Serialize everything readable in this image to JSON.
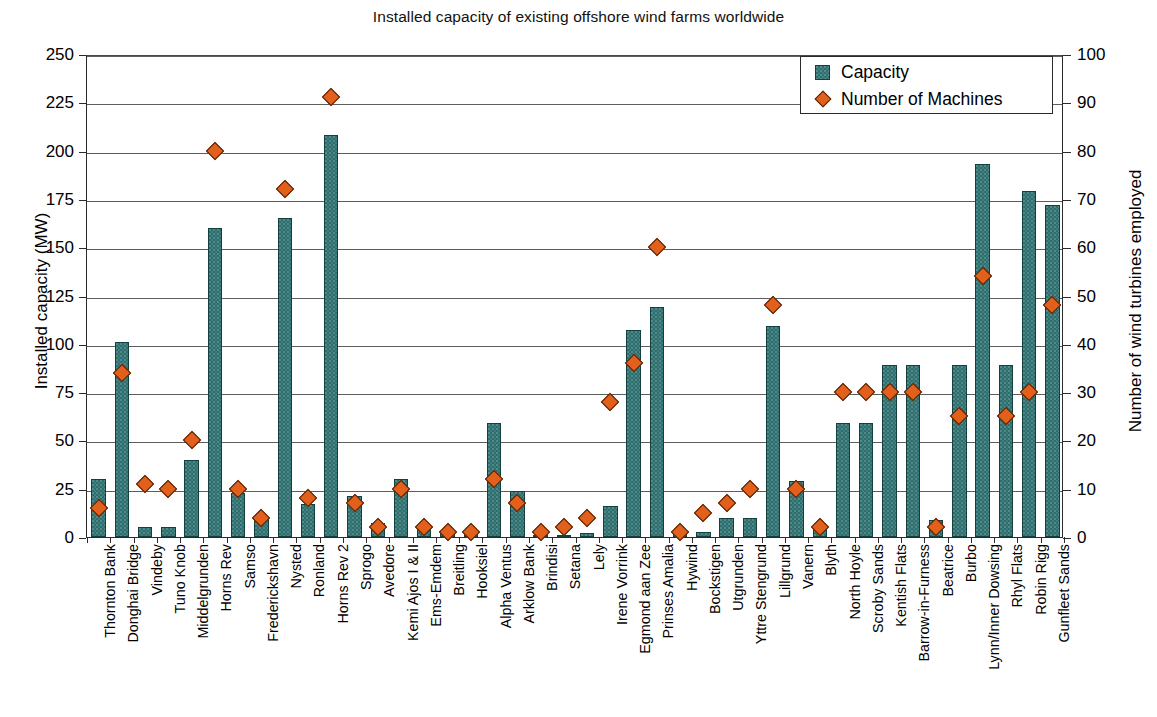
{
  "chart_data": {
    "type": "bar",
    "title": "Installed capacity of existing offshore wind farms worldwide",
    "xlabel": "",
    "ylabel": "Installed capacity (MW)",
    "y2label": "Number of wind turbines employed",
    "ylim": [
      0,
      250
    ],
    "y2lim": [
      0,
      100
    ],
    "yticks": [
      0,
      25,
      50,
      75,
      100,
      125,
      150,
      175,
      200,
      225,
      250
    ],
    "y2ticks": [
      0,
      10,
      20,
      30,
      40,
      50,
      60,
      70,
      80,
      90,
      100
    ],
    "grid": true,
    "legend_position": "top-right",
    "categories": [
      "Thornton Bank",
      "Donghai Bridge",
      "Vindeby",
      "Tuno Knob",
      "Middelgrunden",
      "Horns Rev",
      "Samso",
      "Frederickshavn",
      "Nysted",
      "Ronland",
      "Horns Rev 2",
      "Sprogo",
      "Avedore",
      "Kemi Ajos I & II",
      "Ems-Emdem",
      "Breitling",
      "Hooksiel",
      "Alpha Ventus",
      "Arklow Bank",
      "Brindisi",
      "Setana",
      "Lely",
      "Irene Vorrink",
      "Egmond aan Zee",
      "Prinses Amalia",
      "Hywind",
      "Bockstigen",
      "Utgrunden",
      "Yttre Stengrund",
      "Lillgrund",
      "Vanern",
      "Blyth",
      "North Hoyle",
      "Scroby Sands",
      "Kentish Flats",
      "Barrow-in-Furness",
      "Beatrice",
      "Burbo",
      "Lynn/Inner Dowsing",
      "Rhyl Flats",
      "Robin Rigg",
      "Gunfleet Sands"
    ],
    "series": [
      {
        "name": "Capacity",
        "axis": "left",
        "unit": "MW",
        "color": "#2d6e6e",
        "values": [
          30,
          101,
          5,
          5,
          40,
          160,
          23,
          10,
          165,
          17,
          208,
          21,
          7,
          30,
          4,
          3,
          3,
          59,
          24,
          0,
          1,
          2,
          16,
          107,
          119,
          2,
          2.5,
          10,
          10,
          109,
          29,
          4,
          59,
          59,
          89,
          89,
          9,
          89,
          193,
          89,
          179,
          172
        ]
      },
      {
        "name": "Number of Machines",
        "axis": "right",
        "unit": "turbines",
        "color": "#E2601C",
        "values": [
          6,
          34,
          11,
          10,
          20,
          80,
          10,
          4,
          72,
          8,
          91,
          7,
          2,
          10,
          2,
          1,
          1,
          12,
          7,
          1,
          2,
          4,
          28,
          36,
          60,
          1,
          5,
          7,
          10,
          48,
          10,
          2,
          30,
          30,
          30,
          30,
          2,
          25,
          54,
          25,
          30,
          48
        ]
      }
    ]
  },
  "legend": {
    "items": [
      {
        "label": "Capacity",
        "marker": "bar-swatch"
      },
      {
        "label": "Number of Machines",
        "marker": "diamond-swatch"
      }
    ]
  }
}
